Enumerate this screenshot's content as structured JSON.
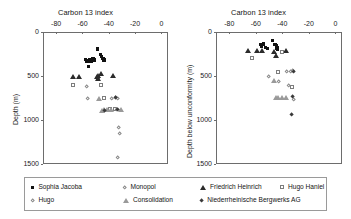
{
  "figure": {
    "panels": [
      {
        "id": "left",
        "title": "Carbon 13 index",
        "ylabel": "Depth (m)",
        "xticks": [
          "-80",
          "-60",
          "-40",
          "-20",
          "0"
        ],
        "yticks": [
          "0",
          "500",
          "1000",
          "1500"
        ]
      },
      {
        "id": "right",
        "title": "Carbon 13 index",
        "ylabel": "Depth below unconformity (m)",
        "xticks": [
          "-80",
          "-60",
          "-40",
          "-20",
          "0"
        ],
        "yticks": [
          "0",
          "500",
          "1000",
          "1500"
        ]
      }
    ]
  },
  "legend": {
    "items": [
      {
        "label": "Sophia Jacoba",
        "marker": "filled-square",
        "color": "#111111"
      },
      {
        "label": "Hugo",
        "marker": "open-diamond",
        "color": "#8a8a8a"
      },
      {
        "label": "Monopol",
        "marker": "open-diamond",
        "color": "#8a8a8a"
      },
      {
        "label": "Consolidation",
        "marker": "open-triangle",
        "color": "#9a9a9a"
      },
      {
        "label": "Friedrich Heinrich",
        "marker": "filled-triangle",
        "color": "#2b2b2b"
      },
      {
        "label": "Niederrheinische  Bergwerks AG",
        "marker": "filled-diamond",
        "color": "#3a3a3a"
      },
      {
        "label": "Hugo Haniel",
        "marker": "open-square",
        "color": "#7d7d7d"
      }
    ]
  },
  "chart_data": [
    {
      "type": "scatter",
      "id": "left",
      "title": "Carbon 13 index",
      "xlabel": "Carbon 13 index",
      "ylabel": "Depth (m)",
      "xlim": [
        -90,
        5
      ],
      "ylim": [
        1500,
        0
      ],
      "yinverted": true,
      "grid": false,
      "legend_position": "bottom",
      "series": [
        {
          "name": "Sophia Jacoba",
          "marker": "filled-square",
          "points": [
            {
              "x": -57.5,
              "y": 310
            },
            {
              "x": -56.5,
              "y": 330
            },
            {
              "x": -54.5,
              "y": 315
            },
            {
              "x": -53.5,
              "y": 335
            },
            {
              "x": -52.0,
              "y": 300
            },
            {
              "x": -51.0,
              "y": 320
            },
            {
              "x": -48.5,
              "y": 195
            },
            {
              "x": -46.5,
              "y": 255
            },
            {
              "x": -45.5,
              "y": 275
            },
            {
              "x": -44.5,
              "y": 300
            },
            {
              "x": -43.5,
              "y": 320
            },
            {
              "x": -55.5,
              "y": 395
            }
          ]
        },
        {
          "name": "Friedrich Heinrich",
          "marker": "filled-triangle",
          "points": [
            {
              "x": -67.0,
              "y": 500
            },
            {
              "x": -63.0,
              "y": 500
            },
            {
              "x": -49.0,
              "y": 505
            },
            {
              "x": -48.0,
              "y": 490
            },
            {
              "x": -46.0,
              "y": 475
            },
            {
              "x": -37.0,
              "y": 495
            },
            {
              "x": -48.5,
              "y": 530
            }
          ]
        },
        {
          "name": "Hugo Haniel",
          "marker": "open-square",
          "points": [
            {
              "x": -67.0,
              "y": 600
            },
            {
              "x": -46.0,
              "y": 600
            },
            {
              "x": -43.5,
              "y": 745
            },
            {
              "x": -39.0,
              "y": 880
            },
            {
              "x": -35.5,
              "y": 880
            }
          ]
        },
        {
          "name": "Monopol",
          "marker": "open-diamond",
          "points": [
            {
              "x": -57.0,
              "y": 620
            },
            {
              "x": -56.0,
              "y": 760
            },
            {
              "x": -37.5,
              "y": 760
            },
            {
              "x": -34.5,
              "y": 745
            },
            {
              "x": -33.5,
              "y": 755
            },
            {
              "x": -34.0,
              "y": 880
            },
            {
              "x": -32.5,
              "y": 1090
            },
            {
              "x": -32.0,
              "y": 1150
            },
            {
              "x": -33.0,
              "y": 1430
            }
          ]
        },
        {
          "name": "Consolidation",
          "marker": "open-triangle",
          "points": [
            {
              "x": -47.5,
              "y": 755
            },
            {
              "x": -45.0,
              "y": 890
            },
            {
              "x": -44.0,
              "y": 885
            },
            {
              "x": -41.5,
              "y": 885
            },
            {
              "x": -38.0,
              "y": 885
            },
            {
              "x": -31.0,
              "y": 885
            }
          ]
        },
        {
          "name": "Niederrheinische  Bergwerks AG",
          "marker": "filled-diamond",
          "points": [
            {
              "x": -43.0,
              "y": 890
            },
            {
              "x": -34.5,
              "y": 745
            },
            {
              "x": -33.0,
              "y": 880
            }
          ]
        }
      ]
    },
    {
      "type": "scatter",
      "id": "right",
      "title": "Carbon 13 index",
      "xlabel": "Carbon 13 index",
      "ylabel": "Depth below unconformity (m)",
      "xlim": [
        -90,
        5
      ],
      "ylim": [
        1500,
        0
      ],
      "yinverted": true,
      "grid": false,
      "legend_position": "bottom",
      "series": [
        {
          "name": "Sophia Jacoba",
          "marker": "filled-square",
          "points": [
            {
              "x": -56.5,
              "y": 145
            },
            {
              "x": -55.5,
              "y": 160
            },
            {
              "x": -54.0,
              "y": 135
            },
            {
              "x": -52.5,
              "y": 175
            },
            {
              "x": -51.0,
              "y": 185
            },
            {
              "x": -47.5,
              "y": 95
            },
            {
              "x": -45.5,
              "y": 140
            },
            {
              "x": -44.5,
              "y": 160
            },
            {
              "x": -44.0,
              "y": 180
            },
            {
              "x": -43.5,
              "y": 200
            }
          ]
        },
        {
          "name": "Friedrich Heinrich",
          "marker": "filled-triangle",
          "points": [
            {
              "x": -66.0,
              "y": 215
            },
            {
              "x": -59.0,
              "y": 215
            },
            {
              "x": -55.5,
              "y": 215
            },
            {
              "x": -46.0,
              "y": 220
            },
            {
              "x": -45.0,
              "y": 270
            },
            {
              "x": -37.5,
              "y": 215
            }
          ]
        },
        {
          "name": "Hugo Haniel",
          "marker": "open-square",
          "points": [
            {
              "x": -63.0,
              "y": 290
            },
            {
              "x": -40.0,
              "y": 225
            },
            {
              "x": -43.0,
              "y": 455
            },
            {
              "x": -33.0,
              "y": 620
            }
          ]
        },
        {
          "name": "Monopol",
          "marker": "open-diamond",
          "points": [
            {
              "x": -50.0,
              "y": 505
            },
            {
              "x": -36.5,
              "y": 455
            },
            {
              "x": -33.5,
              "y": 450
            },
            {
              "x": -32.5,
              "y": 445
            },
            {
              "x": -42.5,
              "y": 560
            },
            {
              "x": -35.5,
              "y": 610
            },
            {
              "x": -31.5,
              "y": 765
            }
          ]
        },
        {
          "name": "Consolidation",
          "marker": "open-triangle",
          "points": [
            {
              "x": -46.5,
              "y": 555
            },
            {
              "x": -44.5,
              "y": 745
            },
            {
              "x": -43.5,
              "y": 745
            },
            {
              "x": -40.0,
              "y": 745
            },
            {
              "x": -37.0,
              "y": 745
            }
          ]
        },
        {
          "name": "Niederrheinische  Bergwerks AG",
          "marker": "filled-diamond",
          "points": [
            {
              "x": -32.0,
              "y": 735
            },
            {
              "x": -33.0,
              "y": 935
            },
            {
              "x": -31.5,
              "y": 450
            }
          ]
        }
      ]
    }
  ]
}
